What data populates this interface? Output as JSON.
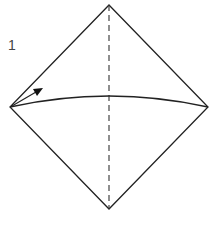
{
  "diagram": {
    "type": "origami-step",
    "step_number": "1",
    "shapes": {
      "square": {
        "top": [
          109,
          5
        ],
        "left": [
          10,
          107
        ],
        "right": [
          208,
          107
        ],
        "bottom": [
          109,
          209
        ],
        "stroke": "#222222"
      },
      "valley_fold_line": {
        "from": [
          109,
          5
        ],
        "to": [
          109,
          209
        ],
        "style": "dashed"
      },
      "fold_arc": {
        "from": [
          10,
          107
        ],
        "control": [
          109,
          85
        ],
        "to": [
          208,
          107
        ]
      },
      "arrow": {
        "from": [
          14,
          104
        ],
        "to": [
          42,
          89
        ],
        "direction": "up-right"
      }
    }
  }
}
